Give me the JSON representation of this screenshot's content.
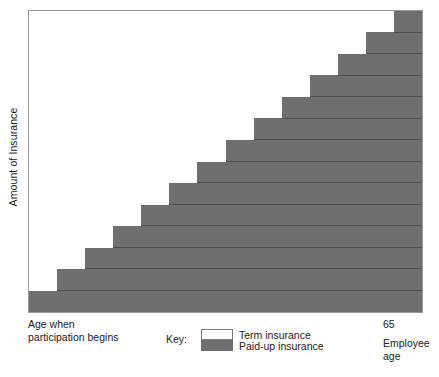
{
  "chart_data": {
    "type": "area",
    "title": "",
    "subtitle": "",
    "xlabel": "Employee age",
    "ylabel": "Amount of Insurance",
    "grid": false,
    "legend_position": "bottom-center",
    "axis_start_label": "Age when participation begins",
    "axis_end_label": "65",
    "xlim_labels": [
      "Age when participation begins",
      "65"
    ],
    "ylim": [
      0,
      100
    ],
    "n_steps": 14,
    "step_width_pct": 7.143,
    "step_height_pct": 7.143,
    "categories": [
      "1",
      "2",
      "3",
      "4",
      "5",
      "6",
      "7",
      "8",
      "9",
      "10",
      "11",
      "12",
      "13",
      "14"
    ],
    "series": [
      {
        "name": "Paid-up insurance",
        "color": "#6f6f6f",
        "values": [
          7.1,
          14.3,
          21.4,
          28.6,
          35.7,
          42.9,
          50.0,
          57.1,
          64.3,
          71.4,
          78.6,
          85.7,
          92.9,
          100.0
        ]
      },
      {
        "name": "Term insurance",
        "color": "#ffffff",
        "values": [
          92.9,
          85.7,
          78.6,
          71.4,
          64.3,
          57.1,
          50.0,
          42.9,
          35.7,
          28.6,
          21.4,
          14.3,
          7.1,
          0.0
        ]
      }
    ],
    "legend": [
      {
        "label": "Term insurance",
        "color": "#ffffff",
        "swatch": "term-swatch"
      },
      {
        "label": "Paid-up insurance",
        "color": "#6f6f6f",
        "swatch": "paid-swatch"
      }
    ]
  },
  "axes": {
    "y_title": "Amount of Insurance",
    "left_caption_line1": "Age when",
    "left_caption_line2": "participation begins",
    "right_tick": "65",
    "x_title_line1": "Employee",
    "x_title_line2": "age"
  },
  "legend": {
    "key_label": "Key:",
    "term_label": "Term insurance",
    "paidup_label": "Paid-up insurance"
  },
  "colors": {
    "paid_up_fill": "#6f6f6f",
    "term_fill": "#ffffff",
    "band_divider": "#4a4a4a",
    "frame": "#9a9a9a",
    "text": "#1b1b1b",
    "background": "#ffffff"
  }
}
